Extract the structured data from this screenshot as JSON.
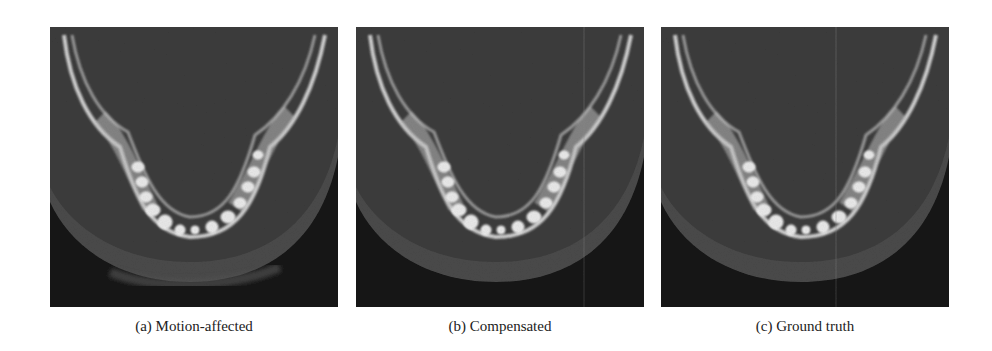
{
  "figure": {
    "panels": [
      {
        "id": "a",
        "label": "(a)",
        "caption": "Motion-affected",
        "image": "CBCT axial slice of mandible with motion artifacts"
      },
      {
        "id": "b",
        "label": "(b)",
        "caption": "Compensated",
        "image": "CBCT axial slice of mandible after motion compensation"
      },
      {
        "id": "c",
        "label": "(c)",
        "caption": "Ground truth",
        "image": "CBCT axial slice of mandible, ground truth"
      }
    ]
  }
}
